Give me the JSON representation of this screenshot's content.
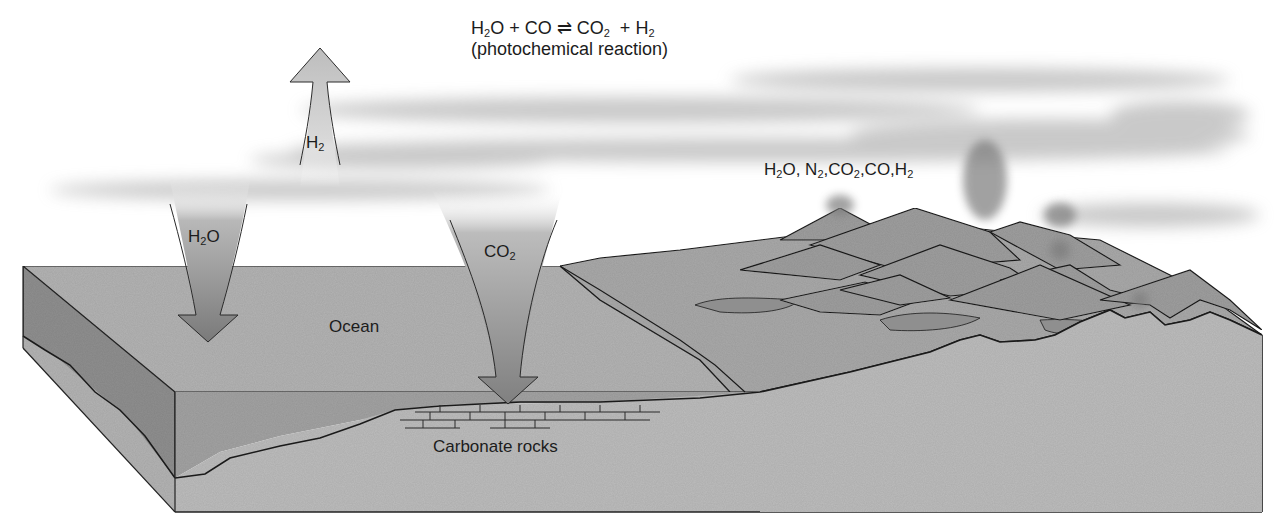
{
  "diagram": {
    "title_equation": {
      "reactants": [
        {
          "base": "H",
          "sub": "2",
          "tail": "O"
        },
        {
          "base": "CO",
          "sub": "",
          "tail": ""
        }
      ],
      "plus": "+",
      "arrow": "⇌",
      "products": [
        {
          "base": "CO",
          "sub": "2",
          "tail": ""
        },
        {
          "base": "H",
          "sub": "2",
          "tail": ""
        }
      ],
      "note": "(photochemical reaction)"
    },
    "arrows": [
      {
        "id": "h2-up",
        "direction": "up",
        "label": {
          "base": "H",
          "sub": "2",
          "tail": ""
        }
      },
      {
        "id": "h2o-down",
        "direction": "down",
        "label": {
          "base": "H",
          "sub": "2",
          "tail": "O"
        }
      },
      {
        "id": "co2-down",
        "direction": "down",
        "label": {
          "base": "CO",
          "sub": "2",
          "tail": ""
        }
      }
    ],
    "volcanic_gases": {
      "items": [
        {
          "base": "H",
          "sub": "2",
          "tail": "O"
        },
        {
          "base": "N",
          "sub": "2",
          "tail": ""
        },
        {
          "base": "CO",
          "sub": "2",
          "tail": ""
        },
        {
          "base": "CO",
          "sub": "",
          "tail": ""
        },
        {
          "base": "H",
          "sub": "2",
          "tail": ""
        }
      ],
      "separator": ","
    },
    "regions": {
      "ocean": "Ocean",
      "carbonate_rocks": "Carbonate rocks"
    },
    "colors": {
      "background": "#ffffff",
      "ocean_top": "#b4b4b4",
      "ocean_side": "#8f8f8f",
      "ocean_front": "#a3a3a3",
      "crust": "#b9b9b9",
      "land": "#a7a7a7",
      "mountain": "#9c9c9c",
      "arrow_light": "#d2d2d2",
      "arrow_dark": "#7d7d7d",
      "cloud": "#9a9a9a",
      "ink": "#1c1c1c"
    }
  }
}
